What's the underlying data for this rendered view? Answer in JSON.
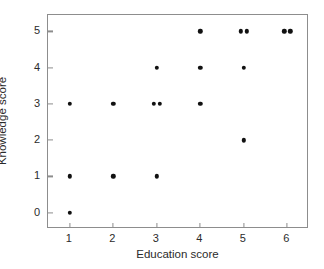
{
  "chart_data": {
    "type": "scatter",
    "title": "",
    "xlabel": "Education score",
    "ylabel": "Knowledge score",
    "xlim": [
      0.5,
      6.5
    ],
    "ylim": [
      -0.45,
      5.45
    ],
    "xticks": [
      1,
      2,
      3,
      4,
      5,
      6
    ],
    "yticks": [
      0,
      1,
      2,
      3,
      4,
      5
    ],
    "xtick_labels": [
      "1",
      "2",
      "3",
      "4",
      "5",
      "6"
    ],
    "ytick_labels": [
      "0",
      "1",
      "2",
      "3",
      "4",
      "5"
    ],
    "grid": false,
    "legend": null,
    "marker": "filled-circle",
    "marker_color": "#111111",
    "frame_color": "#8d8d8d",
    "background": "#ffffff",
    "points": [
      {
        "x": 1,
        "y": 0
      },
      {
        "x": 1,
        "y": 1
      },
      {
        "x": 1,
        "y": 3
      },
      {
        "x": 2,
        "y": 1
      },
      {
        "x": 2,
        "y": 3
      },
      {
        "x": 3,
        "y": 1
      },
      {
        "x": 3,
        "y": 3,
        "jitter": -0.07
      },
      {
        "x": 3,
        "y": 3,
        "jitter": 0.07
      },
      {
        "x": 3,
        "y": 4
      },
      {
        "x": 4,
        "y": 3
      },
      {
        "x": 4,
        "y": 4
      },
      {
        "x": 4,
        "y": 5
      },
      {
        "x": 5,
        "y": 2
      },
      {
        "x": 5,
        "y": 4
      },
      {
        "x": 5,
        "y": 5,
        "jitter": -0.07
      },
      {
        "x": 5,
        "y": 5,
        "jitter": 0.07
      },
      {
        "x": 6,
        "y": 5,
        "jitter": -0.07
      },
      {
        "x": 6,
        "y": 5,
        "jitter": 0.07
      }
    ]
  }
}
